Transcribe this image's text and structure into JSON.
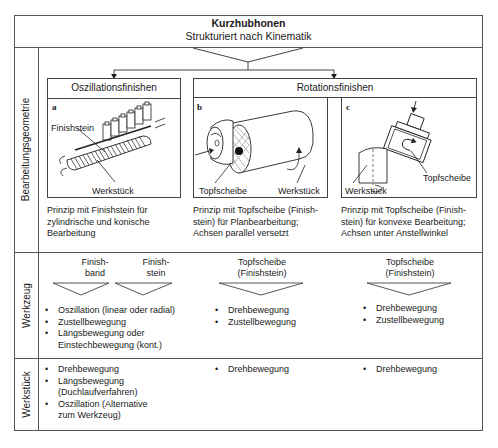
{
  "header": {
    "title": "Kurzhubhonen",
    "subtitle": "Strukturiert nach Kinematik"
  },
  "row_labels": {
    "geometry": "Bearbeitungsgeometrie",
    "tool": "Werkzeug",
    "workpiece": "Werkstück"
  },
  "categories": {
    "oscillation": {
      "title": "Oszillationsfinishen",
      "figure_letter": "a",
      "labels": {
        "stone": "Finishstein",
        "workpiece": "Werkstück"
      },
      "caption_lines": [
        "Prinzip mit Finishstein für",
        "zylindrische und konische",
        "Bearbeitung"
      ]
    },
    "rotation": {
      "title": "Rotationsfinishen",
      "sub_b": {
        "figure_letter": "b",
        "labels": {
          "tool": "Topfscheibe",
          "workpiece": "Werkstück"
        },
        "caption_lines": [
          "Prinzip mit Topfscheibe (Finish-",
          "stein) für Planbearbeitung;",
          "Achsen parallel versetzt"
        ]
      },
      "sub_c": {
        "figure_letter": "c",
        "labels": {
          "tool": "Topfscheibe",
          "workpiece": "Werkstück"
        },
        "caption_lines": [
          "Prinzip mit Topfscheibe (Finish-",
          "stein) für konvexe Bearbeitung;",
          "Achsen unter Anstellwinkel"
        ]
      }
    }
  },
  "tool_row": {
    "col_a": {
      "tools": [
        {
          "line1": "Finish-",
          "line2": "band"
        },
        {
          "line1": "Finish-",
          "line2": "stein"
        }
      ],
      "bullets": [
        "Oszillation (linear oder radial)",
        "Zustellbewegung",
        "Längsbewegung oder",
        "Einstechbewegung (kont.)"
      ]
    },
    "col_b": {
      "tool": {
        "line1": "Topfscheibe",
        "line2": "(Finishstein)"
      },
      "bullets": [
        "Drehbewegung",
        "Zustellbewegung"
      ]
    },
    "col_c": {
      "tool": {
        "line1": "Topfscheibe",
        "line2": "(Finishstein)"
      },
      "bullets": [
        "Drehbewegung",
        "Zustellbewegung"
      ]
    }
  },
  "workpiece_row": {
    "col_a": {
      "bullets": [
        "Drehbewegung",
        "Längsbewegung",
        "(Duchlaufverfahren)",
        "Oszillation (Alternative",
        "zum Werkzeug)"
      ]
    },
    "col_b": {
      "bullets": [
        "Drehbewegung"
      ]
    },
    "col_c": {
      "bullets": [
        "Drehbewegung"
      ]
    }
  }
}
